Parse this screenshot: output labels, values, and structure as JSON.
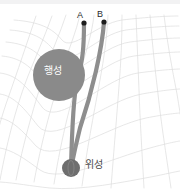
{
  "figure": {
    "background_color": "#ffffff",
    "top_band_color": "#f2f2f3"
  },
  "labels": {
    "point_a": "A",
    "point_b": "B",
    "planet": "행성",
    "satellite": "위성"
  },
  "bodies": {
    "planet": {
      "name": "행성",
      "cx": 59,
      "cy": 75,
      "r": 26,
      "color": "#8a8a8a"
    },
    "satellite": {
      "name": "위성",
      "cx": 71,
      "cy": 168,
      "r": 9,
      "color": "#6e6e6e"
    }
  },
  "points": {
    "a": {
      "label": "A",
      "x": 84,
      "y": 23,
      "r": 2.4,
      "color": "#1d1d1d"
    },
    "b": {
      "label": "B",
      "x": 104,
      "y": 22,
      "r": 2.4,
      "color": "#1d1d1d"
    }
  },
  "beams": {
    "color": "#8e8e8e",
    "width": 4.2,
    "beam_a_path": "M 84 23 C 84 48, 83 62, 78 84",
    "beam_b_path": "M 104 22 C 101 52, 86 96, 71 168"
  },
  "grid": {
    "color": "#dcdcdc",
    "color_strong": "#cfcfcf",
    "stroke_width": 0.7,
    "description": "curved-spacetime-perspective-grid"
  },
  "colors": {
    "planet": "#8a8a8a",
    "satellite": "#6e6e6e",
    "beam": "#8e8e8e",
    "grid": "#dcdcdc",
    "label_text": "#2b2b2b",
    "planet_label_text": "#ffffff",
    "background": "#ffffff"
  }
}
